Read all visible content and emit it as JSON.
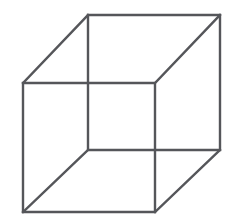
{
  "figure": {
    "name": "necker-cube",
    "type": "line-drawing",
    "canvas": {
      "width": 234,
      "height": 223,
      "background_color": "#ffffff"
    },
    "style": {
      "stroke_color": "#55565a",
      "stroke_width": 2.4,
      "fill": "none"
    },
    "geometry": {
      "square_side": 132,
      "offset_x": -65,
      "offset_y": 68,
      "back_square": {
        "name": "upper-right-square",
        "points": "88,15 220,15 220,150 88,150",
        "corners": [
          {
            "name": "back-top-left",
            "x": 88,
            "y": 15
          },
          {
            "name": "back-top-right",
            "x": 220,
            "y": 15
          },
          {
            "name": "back-bottom-right",
            "x": 220,
            "y": 150
          },
          {
            "name": "back-bottom-left",
            "x": 88,
            "y": 150
          }
        ]
      },
      "front_square": {
        "name": "lower-left-square",
        "points": "23,83 155,83 155,212 23,212",
        "corners": [
          {
            "name": "front-top-left",
            "x": 23,
            "y": 83
          },
          {
            "name": "front-top-right",
            "x": 155,
            "y": 83
          },
          {
            "name": "front-bottom-right",
            "x": 155,
            "y": 212
          },
          {
            "name": "front-bottom-left",
            "x": 23,
            "y": 212
          }
        ]
      },
      "connectors": [
        {
          "name": "connector-top-left",
          "x1": 23,
          "y1": 83,
          "x2": 88,
          "y2": 15
        },
        {
          "name": "connector-top-right",
          "x1": 155,
          "y1": 83,
          "x2": 220,
          "y2": 15
        },
        {
          "name": "connector-bottom-right",
          "x1": 155,
          "y1": 212,
          "x2": 220,
          "y2": 150
        },
        {
          "name": "connector-bottom-left",
          "x1": 23,
          "y1": 212,
          "x2": 88,
          "y2": 150
        }
      ]
    }
  }
}
